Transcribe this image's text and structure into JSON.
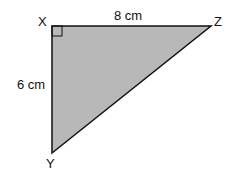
{
  "diagram": {
    "type": "right-triangle",
    "vertices": {
      "X": {
        "label": "X",
        "x": 52,
        "y": 26
      },
      "Z": {
        "label": "Z",
        "x": 211,
        "y": 26
      },
      "Y": {
        "label": "Y",
        "x": 52,
        "y": 153
      }
    },
    "right_angle_at": "X",
    "sides": {
      "XZ": {
        "label": "8 cm"
      },
      "XY": {
        "label": "6 cm"
      }
    },
    "fill_color": "#b8b8b8",
    "stroke_color": "#111111"
  }
}
